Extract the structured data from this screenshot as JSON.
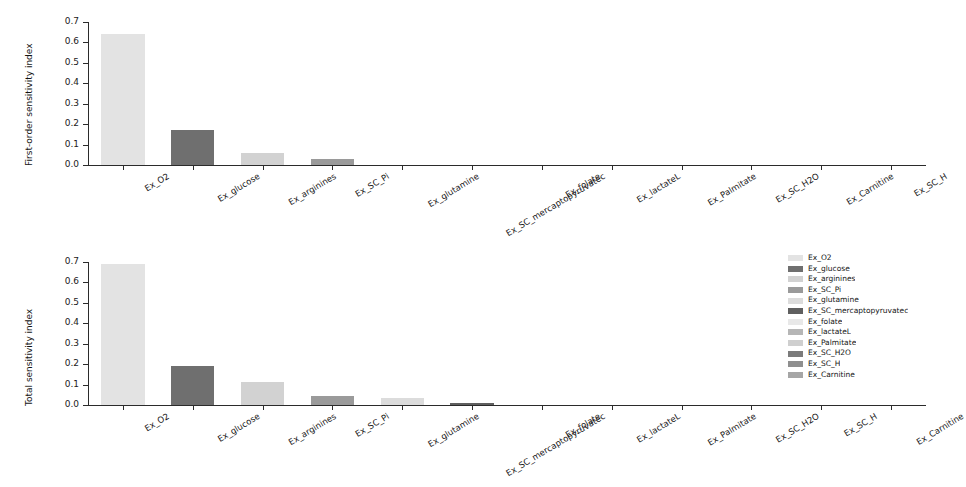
{
  "chart_data": [
    {
      "type": "bar",
      "title": "",
      "xlabel": "",
      "ylabel": "First-order sensitivity index",
      "ylim": [
        0.0,
        0.7
      ],
      "yticks": [
        "0.0",
        "0.1",
        "0.2",
        "0.3",
        "0.4",
        "0.5",
        "0.6",
        "0.7"
      ],
      "grid": false,
      "legend_position": "none",
      "categories": [
        "Ex_O2",
        "Ex_glucose",
        "Ex_arginines",
        "Ex_SC_Pi",
        "Ex_glutamine",
        "Ex_SC_mercaptopyruvatec",
        "Ex_folate",
        "Ex_lactateL",
        "Ex_Palmitate",
        "Ex_SC_H2O",
        "Ex_Carnitine",
        "Ex_SC_H"
      ],
      "values": [
        0.64,
        0.17,
        0.058,
        0.028,
        0.0,
        0.0,
        0.0,
        0.0,
        0.0,
        0.0,
        0.0,
        0.0
      ],
      "colors": [
        "#e3e3e3",
        "#6f6f6f",
        "#d2d2d2",
        "#9a9a9a",
        "#dcdcdc",
        "#5f5f5f",
        "#e8e8e8",
        "#b6b6b6",
        "#cfcfcf",
        "#7b7b7b",
        "#8f8f8f",
        "#a6a6a6"
      ]
    },
    {
      "type": "bar",
      "title": "",
      "xlabel": "",
      "ylabel": "Total sensitivity index",
      "ylim": [
        0.0,
        0.7
      ],
      "yticks": [
        "0.0",
        "0.1",
        "0.2",
        "0.3",
        "0.4",
        "0.5",
        "0.6",
        "0.7"
      ],
      "grid": false,
      "legend_position": "right",
      "categories": [
        "Ex_O2",
        "Ex_glucose",
        "Ex_arginines",
        "Ex_SC_Pi",
        "Ex_glutamine",
        "Ex_SC_mercaptopyruvatec",
        "Ex_folate",
        "Ex_lactateL",
        "Ex_Palmitate",
        "Ex_SC_H2O",
        "Ex_SC_H",
        "Ex_Carnitine"
      ],
      "values": [
        0.69,
        0.19,
        0.114,
        0.042,
        0.036,
        0.008,
        0.0,
        0.0,
        0.0,
        0.0,
        0.0,
        0.0
      ],
      "colors": [
        "#e3e3e3",
        "#6f6f6f",
        "#d2d2d2",
        "#9a9a9a",
        "#dcdcdc",
        "#5f5f5f",
        "#e8e8e8",
        "#b6b6b6",
        "#cfcfcf",
        "#7b7b7b",
        "#8f8f8f",
        "#a6a6a6"
      ]
    }
  ],
  "legend": {
    "items": [
      {
        "label": "Ex_O2",
        "color": "#e3e3e3"
      },
      {
        "label": "Ex_glucose",
        "color": "#6f6f6f"
      },
      {
        "label": "Ex_arginines",
        "color": "#d2d2d2"
      },
      {
        "label": "Ex_SC_Pi",
        "color": "#9a9a9a"
      },
      {
        "label": "Ex_glutamine",
        "color": "#dcdcdc"
      },
      {
        "label": "Ex_SC_mercaptopyruvatec",
        "color": "#5f5f5f"
      },
      {
        "label": "Ex_folate",
        "color": "#e8e8e8"
      },
      {
        "label": "Ex_lactateL",
        "color": "#b6b6b6"
      },
      {
        "label": "Ex_Palmitate",
        "color": "#cfcfcf"
      },
      {
        "label": "Ex_SC_H2O",
        "color": "#7b7b7b"
      },
      {
        "label": "Ex_SC_H",
        "color": "#8f8f8f"
      },
      {
        "label": "Ex_Carnitine",
        "color": "#a6a6a6"
      }
    ]
  }
}
